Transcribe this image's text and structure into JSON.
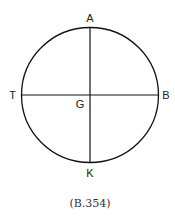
{
  "diagram": {
    "circle": {
      "cx": 90,
      "cy": 95,
      "rx": 68.5,
      "ry": 67.5,
      "stroke": "#111111"
    },
    "labels": {
      "top": "A",
      "left": "T",
      "right": "B",
      "center": "G",
      "bottom": "K"
    },
    "caption": "(B.354)"
  }
}
